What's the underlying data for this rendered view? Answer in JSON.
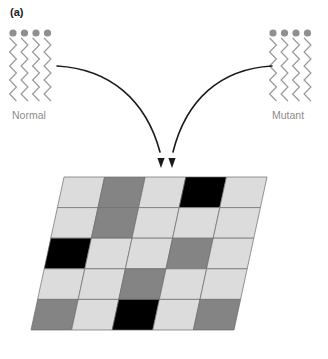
{
  "figure": {
    "panel_label": "(a)",
    "background_color": "#ffffff"
  },
  "lipid_groups": [
    {
      "id": "normal",
      "label": "Normal",
      "label_color": "#8c8c8c",
      "side": "left",
      "tail_count": 4,
      "head_color": "#8f8f8f",
      "tail_color": "#9a9a9a",
      "head_radius": 3.6,
      "origin_x": 13,
      "head_y": 33,
      "tail_top": 38,
      "tail_bottom": 101,
      "tail_spacing": 11.5,
      "label_x": 12,
      "label_y": 119
    },
    {
      "id": "mutant",
      "label": "Mutant",
      "label_color": "#8c8c8c",
      "side": "right",
      "tail_count": 4,
      "head_color": "#8f8f8f",
      "tail_color": "#9a9a9a",
      "head_radius": 3.6,
      "origin_x": 273,
      "head_y": 33,
      "tail_top": 38,
      "tail_bottom": 101,
      "tail_spacing": 11.5,
      "label_x": 272,
      "label_y": 119
    }
  ],
  "arrows": {
    "color": "#1a1a1a",
    "stroke_width": 1.6,
    "paths": [
      {
        "id": "arrow-from-normal",
        "d": "M 57 66 C 110 69 146 100 160 152",
        "tip_x": 161,
        "tip_y": 168
      },
      {
        "id": "arrow-from-mutant",
        "d": "M 272 66 C 220 69 186 100 173 152",
        "tip_x": 172,
        "tip_y": 168
      }
    ]
  },
  "membrane_grid": {
    "rows": 5,
    "columns": 5,
    "top_left": {
      "x": 64,
      "y": 177
    },
    "top_right": {
      "x": 267,
      "y": 177
    },
    "bottom_left": {
      "x": 31,
      "y": 330
    },
    "bottom_right": {
      "x": 235,
      "y": 330
    },
    "border_color": "#6b6b6b",
    "shades": {
      "light": "#dcdcdc",
      "medium": "#848484",
      "dark": "#000000"
    },
    "cells": [
      [
        "light",
        "medium",
        "light",
        "dark",
        "light"
      ],
      [
        "light",
        "medium",
        "light",
        "light",
        "light"
      ],
      [
        "dark",
        "light",
        "light",
        "medium",
        "light"
      ],
      [
        "light",
        "light",
        "medium",
        "light",
        "light"
      ],
      [
        "medium",
        "light",
        "dark",
        "light",
        "medium"
      ]
    ]
  }
}
